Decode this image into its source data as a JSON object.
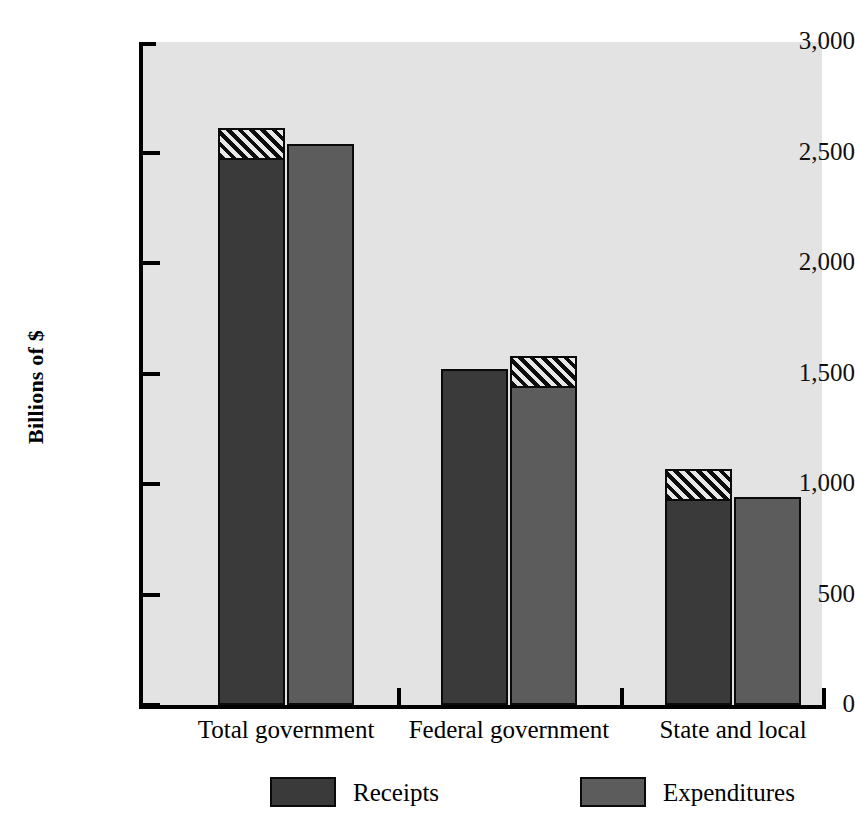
{
  "chart_data": {
    "type": "bar",
    "title": "",
    "xlabel": "",
    "ylabel": "Billions of $",
    "ylim": [
      0,
      3000
    ],
    "yticks": [
      0,
      500,
      1000,
      1500,
      2000,
      2500,
      3000
    ],
    "ytick_labels": [
      "0",
      "500",
      "1,000",
      "1,500",
      "2,000",
      "2,500",
      "3,000"
    ],
    "grid": false,
    "legend_position": "bottom",
    "categories": [
      "Total government",
      "Federal government",
      "State and local"
    ],
    "series": [
      {
        "name": "Receipts",
        "values": [
          2610,
          1520,
          1070
        ],
        "color": "#3a3a3a"
      },
      {
        "name": "Expenditures",
        "values": [
          2540,
          1580,
          940
        ],
        "color": "#5c5c5c"
      }
    ],
    "annotations": [
      "Tallest bar in each group is capped with a diagonal hatch band",
      "Total government: Receipts exceed Expenditures",
      "Federal government: Expenditures exceed Receipts",
      "State and local: Receipts exceed Expenditures"
    ]
  },
  "legend": {
    "items": [
      {
        "label": "Receipts"
      },
      {
        "label": "Expenditures"
      }
    ]
  },
  "colors": {
    "receipts": "#3a3a3a",
    "expenditures": "#5c5c5c",
    "plot_background": "#e3e3e3",
    "axis": "#000000",
    "page_background": "#ffffff"
  }
}
